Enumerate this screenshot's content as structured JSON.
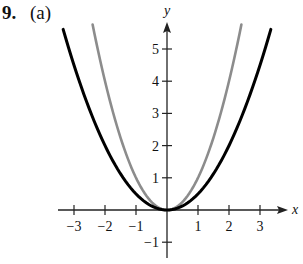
{
  "header": {
    "exercise_number": "9.",
    "part": "(a)"
  },
  "chart_data": {
    "type": "line",
    "title": "",
    "xlabel": "x",
    "ylabel": "y",
    "xlim": [
      -3.5,
      3.8
    ],
    "ylim": [
      -1.5,
      5.8
    ],
    "grid": false,
    "legend": "none",
    "x_ticks": [
      -3,
      -2,
      -1,
      1,
      2,
      3
    ],
    "x_tick_labels": [
      "−3",
      "−2",
      "−1",
      "1",
      "2",
      "3"
    ],
    "y_ticks": [
      -1,
      1,
      2,
      3,
      4,
      5
    ],
    "y_tick_labels": [
      "−1",
      "1",
      "2",
      "3",
      "4",
      "5"
    ],
    "series": [
      {
        "name": "y = x^2",
        "color": "#8c8c8c",
        "x": [
          -2.4,
          -2,
          -1.5,
          -1,
          -0.5,
          0,
          0.5,
          1,
          1.5,
          2,
          2.4
        ],
        "values": [
          5.76,
          4,
          2.25,
          1,
          0.25,
          0,
          0.25,
          1,
          2.25,
          4,
          5.76
        ]
      },
      {
        "name": "y = (1/2)x^2",
        "color": "#000000",
        "x": [
          -3.35,
          -3,
          -2,
          -1,
          0,
          1,
          2,
          3,
          3.35
        ],
        "values": [
          5.61,
          4.5,
          2,
          0.5,
          0,
          0.5,
          2,
          4.5,
          5.61
        ]
      }
    ]
  },
  "layout": {
    "origin_px": [
      167,
      210
    ],
    "unit_x_px": 31,
    "unit_y_px": 32.2
  }
}
